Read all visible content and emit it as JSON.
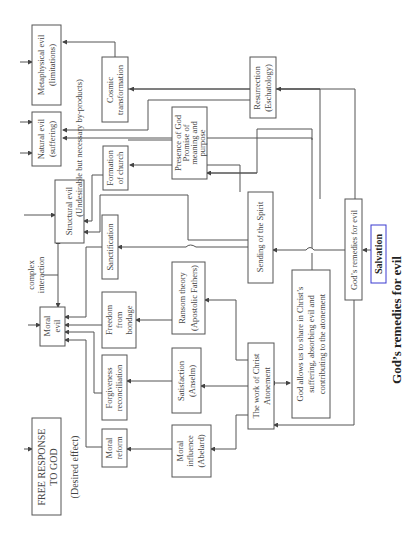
{
  "diagram": {
    "title": "God’s remedies for evil",
    "salvation": "Salvation",
    "remedies_label": "God’s remedies for evil",
    "evils": {
      "metaphysical": [
        "Metaphysical evil",
        "(limitations)"
      ],
      "natural": [
        "Natural evil",
        "(suffering)"
      ],
      "structural": [
        "Structural evil"
      ],
      "moral": [
        "Moral",
        "evil"
      ]
    },
    "free_response": [
      "FREE RESPONSE",
      "TO GOD"
    ],
    "desired_effect": "(Desired effect)",
    "undesirable_note": "(Undesirable but necessary by-products)",
    "complex_interaction": [
      "complex",
      "interaction"
    ],
    "effects": {
      "cosmic": [
        "Cosmic",
        "transformation"
      ],
      "formation_church": [
        "Formation",
        "of church"
      ],
      "sanctification": [
        "Sanctification"
      ],
      "freedom": [
        "Freedom",
        "from",
        "bondage"
      ],
      "forgiveness": [
        "Forgiveness",
        "reconciliation"
      ],
      "moral_reform": [
        "Moral",
        "reform"
      ]
    },
    "theories": {
      "presence": [
        "Presence of God",
        "Promise of",
        "meaning and",
        "purpose"
      ],
      "ransom": [
        "Ransom theory",
        "(Apostolic Fathers)"
      ],
      "satisfaction": [
        "Satisfaction",
        "(Anselm)"
      ],
      "moral_influence": [
        "Moral",
        "influence",
        "(Abelard)"
      ]
    },
    "work_of_christ": [
      "The work of Christ",
      "Atonement"
    ],
    "sending_spirit": [
      "Sending of the Spirit"
    ],
    "god_allows": [
      "God allows us to share in Christ’s",
      "suffering, absorbing evil and",
      "contributing to the atonement"
    ],
    "resurrection": [
      "Resurrection",
      "(Eschatology)"
    ],
    "colors": {
      "line": "#555555",
      "text": "#444444",
      "salvation_border": "#3a3ad0"
    }
  }
}
